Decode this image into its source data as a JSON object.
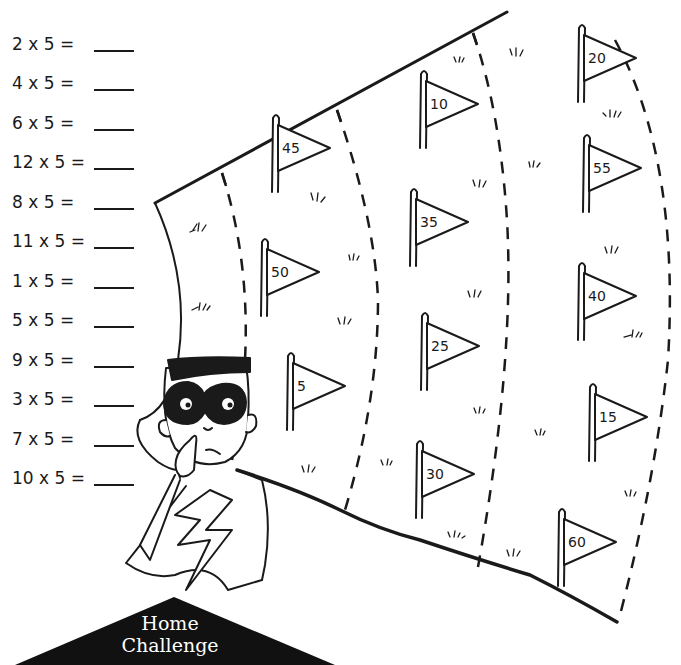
{
  "worksheet": {
    "problems": [
      {
        "text": "2 x 5 =",
        "answer": ""
      },
      {
        "text": "4 x 5 =",
        "answer": ""
      },
      {
        "text": "6 x 5 =",
        "answer": ""
      },
      {
        "text": "12 x 5 =",
        "answer": ""
      },
      {
        "text": "8 x 5 =",
        "answer": ""
      },
      {
        "text": "11 x 5 =",
        "answer": ""
      },
      {
        "text": "1 x 5 =",
        "answer": ""
      },
      {
        "text": "5 x 5 =",
        "answer": ""
      },
      {
        "text": "9 x 5 =",
        "answer": ""
      },
      {
        "text": "3 x 5 =",
        "answer": ""
      },
      {
        "text": "7 x 5 =",
        "answer": ""
      },
      {
        "text": "10 x 5 =",
        "answer": ""
      }
    ],
    "flags": [
      {
        "value": "45",
        "x": 272,
        "y": 114
      },
      {
        "value": "10",
        "x": 420,
        "y": 70
      },
      {
        "value": "20",
        "x": 578,
        "y": 24
      },
      {
        "value": "55",
        "x": 583,
        "y": 134
      },
      {
        "value": "35",
        "x": 410,
        "y": 188
      },
      {
        "value": "50",
        "x": 261,
        "y": 238
      },
      {
        "value": "40",
        "x": 578,
        "y": 262
      },
      {
        "value": "25",
        "x": 421,
        "y": 312
      },
      {
        "value": "5",
        "x": 287,
        "y": 352
      },
      {
        "value": "15",
        "x": 589,
        "y": 383
      },
      {
        "value": "30",
        "x": 416,
        "y": 440
      },
      {
        "value": "60",
        "x": 558,
        "y": 508
      }
    ],
    "banner": {
      "line1": "Home",
      "line2": "Challenge"
    }
  }
}
